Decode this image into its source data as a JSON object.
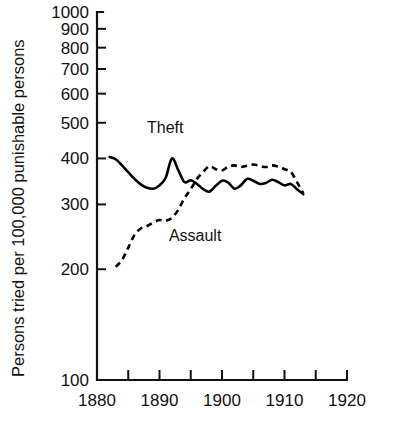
{
  "chart_data": {
    "type": "line",
    "title": "",
    "xlabel": "",
    "ylabel": "Persons tried per 100,000 punishable persons",
    "yscale": "log",
    "ylim": [
      100,
      1000
    ],
    "xlim": [
      1880,
      1920
    ],
    "grid": false,
    "legend_position": "inline-annotations",
    "y_tick_labels": [
      "1000",
      "900",
      "800",
      "700",
      "600",
      "500",
      "400",
      "300",
      "200",
      "100"
    ],
    "y_tick_values": [
      1000,
      900,
      800,
      700,
      600,
      500,
      400,
      300,
      200,
      100
    ],
    "x_tick_labels": [
      "1880",
      "1890",
      "1900",
      "1910",
      "1920"
    ],
    "x_tick_values": [
      1880,
      1890,
      1900,
      1910,
      1920
    ],
    "x_minor_ticks": [
      1885,
      1895,
      1905,
      1915
    ],
    "series": [
      {
        "name": "Theft",
        "style": "solid",
        "annotation": "Theft",
        "x": [
          1882,
          1883,
          1884,
          1885,
          1886,
          1887,
          1888,
          1889,
          1890,
          1891,
          1892,
          1893,
          1894,
          1895,
          1896,
          1897,
          1898,
          1899,
          1900,
          1901,
          1902,
          1903,
          1904,
          1905,
          1906,
          1907,
          1908,
          1909,
          1910,
          1911,
          1912,
          1913
        ],
        "values": [
          404,
          398,
          383,
          367,
          352,
          340,
          333,
          331,
          338,
          355,
          400,
          372,
          345,
          349,
          341,
          330,
          325,
          337,
          348,
          344,
          331,
          338,
          352,
          348,
          341,
          343,
          350,
          345,
          338,
          341,
          330,
          320
        ]
      },
      {
        "name": "Assault",
        "style": "dashed",
        "annotation": "Assault",
        "x": [
          1883,
          1884,
          1885,
          1886,
          1887,
          1888,
          1889,
          1890,
          1891,
          1892,
          1893,
          1894,
          1895,
          1896,
          1897,
          1898,
          1899,
          1900,
          1901,
          1902,
          1903,
          1904,
          1905,
          1906,
          1907,
          1908,
          1909,
          1910,
          1911,
          1912,
          1913
        ],
        "values": [
          203,
          212,
          229,
          248,
          258,
          262,
          268,
          272,
          271,
          276,
          290,
          312,
          330,
          352,
          368,
          381,
          374,
          371,
          380,
          383,
          379,
          382,
          385,
          382,
          379,
          383,
          380,
          374,
          368,
          345,
          322
        ]
      }
    ],
    "annotations": [
      {
        "text": "Theft",
        "x": 1888.0,
        "y": 470
      },
      {
        "text": "Assault",
        "x": 1891.5,
        "y": 238
      }
    ]
  },
  "axis": {
    "y_label_text": "Persons tried per 100,000 punishable persons"
  }
}
